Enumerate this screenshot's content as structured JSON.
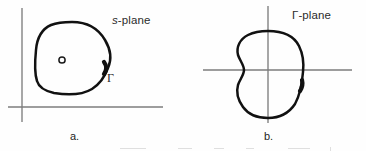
{
  "figure": {
    "background_color": "#fefefe",
    "ink_color": "#111111",
    "axis_color": "#7d7d7d",
    "panels": [
      {
        "id": "panel-a",
        "caption": "a.",
        "plane_label_prefix": "s",
        "plane_label_suffix": "-plane",
        "plane_label_full": "s-plane",
        "curve_label": "Γ",
        "pole_marker": "o",
        "axes": {
          "vertical_x": 22,
          "vertical_y1": 8,
          "vertical_y2": 122,
          "horizontal_y": 107,
          "horizontal_x1": 8,
          "horizontal_x2": 163
        },
        "contour": {
          "type": "closed-convex-blob",
          "bounds": [
            36,
            22,
            110,
            93
          ],
          "direction": "clockwise",
          "arrow_at": [
            103,
            69
          ]
        },
        "marker": {
          "shape": "circle",
          "center": [
            62,
            60
          ],
          "radius": 3
        }
      },
      {
        "id": "panel-b",
        "caption": "b.",
        "plane_label_prefix": "Γ",
        "plane_label_suffix": "-plane",
        "plane_label_full": "Γ-plane",
        "curve_label": "",
        "pole_marker": "",
        "axes": {
          "vertical_x": 268,
          "vertical_y1": 6,
          "vertical_y2": 123,
          "horizontal_y": 70,
          "horizontal_x1": 203,
          "horizontal_x2": 352
        },
        "contour": {
          "type": "closed-kidney-blob",
          "bounds": [
            234,
            30,
            304,
            119
          ],
          "direction": "clockwise",
          "arrow_at": [
            301,
            86
          ]
        }
      }
    ]
  }
}
